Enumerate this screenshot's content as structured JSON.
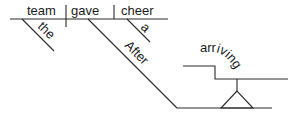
{
  "diagram": {
    "type": "reed-kellogg-sentence-diagram",
    "sentence_words": [
      "After",
      "arriving",
      "the",
      "team",
      "gave",
      "a",
      "cheer"
    ],
    "main_clause": {
      "subject": "team",
      "verb": "gave",
      "direct_object": "cheer"
    },
    "modifiers": {
      "subject_modifier": "the",
      "object_modifier": "a",
      "preposition": "After"
    },
    "gerund_phrase": {
      "gerund": "arriving"
    },
    "colors": {
      "line": "#2a2a2a",
      "text": "#1a1a1a",
      "background": "#ffffff"
    }
  }
}
